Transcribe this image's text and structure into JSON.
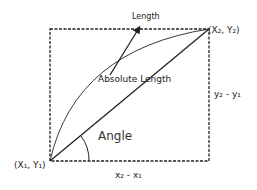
{
  "diagram": {
    "labels": {
      "length": "Length",
      "absolute_length": "Absolute Length",
      "angle": "Angle",
      "point_start": "(X₁, Y₁)",
      "point_end": "(X₂, Y₂)",
      "dx": "x₂ - x₁",
      "dy": "y₂ - y₁"
    },
    "colors": {
      "stroke": "#222222",
      "background": "#ffffff"
    }
  }
}
